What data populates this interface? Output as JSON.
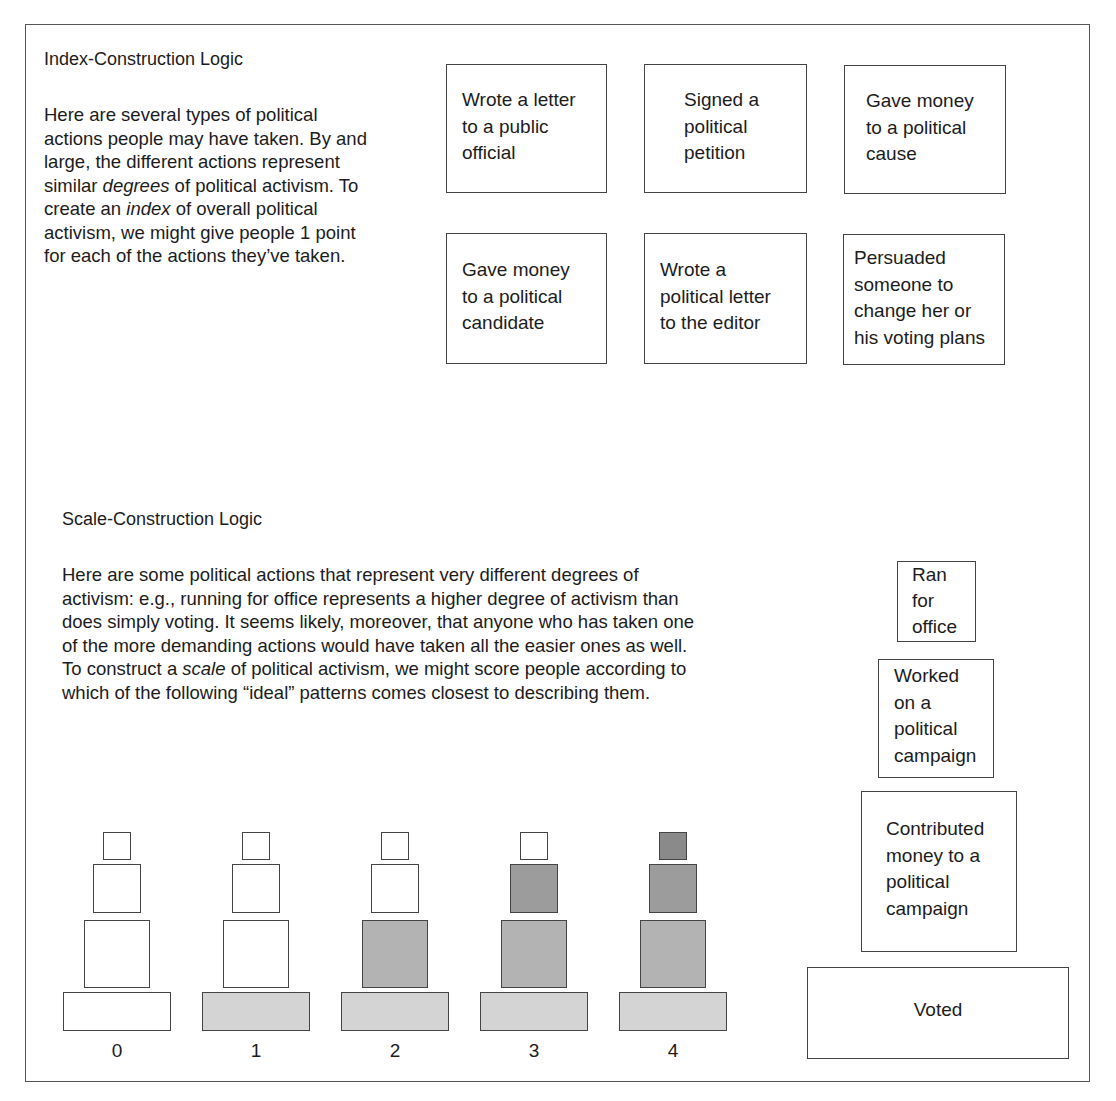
{
  "index_section": {
    "title": "Index-Construction Logic",
    "paragraph_lines": [
      "Here are several types of political",
      "actions people may have taken. By and",
      "large, the different actions represent",
      "similar ",
      "degrees",
      " of political activism. To",
      "create an ",
      "index",
      " of overall political",
      "activism, we might give people 1 point",
      "for each of the actions they’ve taken."
    ],
    "actions": [
      {
        "label": "Wrote a letter\nto a public\nofficial"
      },
      {
        "label": "Signed a\npolitical\npetition"
      },
      {
        "label": "Gave money\nto a political\ncause"
      },
      {
        "label": "Gave money\nto a political\ncandidate"
      },
      {
        "label": "Wrote a\npolitical letter\nto the editor"
      },
      {
        "label": "Persuaded\nsomeone to\nchange her or\nhis voting plans"
      }
    ]
  },
  "scale_section": {
    "title": "Scale-Construction Logic",
    "paragraph_lines": [
      "Here are some political actions that represent very different degrees of",
      "activism: e.g., running for office represents a higher degree of activism than",
      "does simply voting. It seems likely, moreover, that anyone who has taken one",
      "of the more demanding actions would have taken all the easier ones as well.",
      "To construct a ",
      "scale",
      " of political activism, we might score people according to",
      "which of the following “ideal” patterns comes closest to describing them."
    ],
    "hierarchy": [
      {
        "label": "Ran\nfor\noffice"
      },
      {
        "label": "Worked\non a\npolitical\ncampaign"
      },
      {
        "label": "Contributed\nmoney to a\npolitical\ncampaign"
      },
      {
        "label": "Voted"
      }
    ],
    "patterns": [
      {
        "score": "0",
        "filled": [
          false,
          false,
          false,
          false
        ]
      },
      {
        "score": "1",
        "filled": [
          true,
          false,
          false,
          false
        ]
      },
      {
        "score": "2",
        "filled": [
          true,
          true,
          false,
          false
        ]
      },
      {
        "score": "3",
        "filled": [
          true,
          true,
          true,
          false
        ]
      },
      {
        "score": "4",
        "filled": [
          true,
          true,
          true,
          true
        ]
      }
    ],
    "fill_colors": {
      "level1": "#d4d4d4",
      "level2": "#b3b3b3",
      "level3": "#9c9c9c",
      "level4": "#8a8a8a",
      "empty": "#ffffff"
    }
  }
}
